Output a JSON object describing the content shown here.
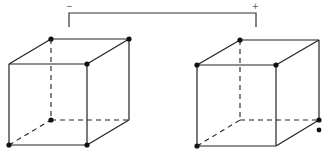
{
  "diagram": {
    "bracket": {
      "left_sign": "−",
      "right_sign": "+"
    },
    "left_cube": {
      "vertices": {
        "back_top_left": [
          51,
          39
        ],
        "back_top_right": [
          129,
          39
        ],
        "front_top_left": [
          9,
          64
        ],
        "front_top_right": [
          87,
          64
        ],
        "back_bottom_left": [
          51,
          120
        ],
        "back_bottom_right": [
          129,
          120
        ],
        "front_bottom_left": [
          9,
          145
        ],
        "front_bottom_right": [
          87,
          145
        ]
      },
      "dotted_vertices": [
        "back_top_left",
        "back_top_right",
        "front_top_right",
        "back_bottom_left",
        "front_bottom_left",
        "front_bottom_right"
      ]
    },
    "right_cube": {
      "vertices": {
        "back_top_left": [
          240,
          40
        ],
        "back_top_right": [
          319,
          40
        ],
        "front_top_left": [
          197,
          65
        ],
        "front_top_right": [
          276,
          65
        ],
        "back_bottom_left": [
          240,
          120
        ],
        "back_bottom_right": [
          319,
          120
        ],
        "front_bottom_left": [
          197,
          146
        ],
        "front_bottom_right": [
          276,
          146
        ]
      },
      "dotted_vertices": [
        "back_top_left",
        "front_top_left",
        "front_top_right",
        "back_bottom_right",
        "front_bottom_left"
      ],
      "extra_dot": [
        319,
        130
      ]
    },
    "colors": {
      "line": "#222222",
      "dot": "#111111",
      "background": "#ffffff"
    }
  }
}
